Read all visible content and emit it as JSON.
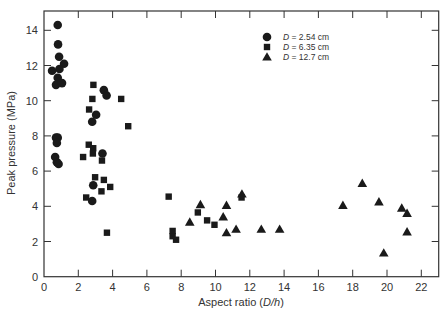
{
  "chart_data": {
    "type": "scatter",
    "title": "",
    "xlabel": "Aspect ratio (D/h)",
    "xlabel_plain": "Aspect ratio (",
    "xlabel_italic": "D/h",
    "xlabel_close": ")",
    "ylabel": "Peak pressure (MPa)",
    "xlim": [
      0,
      23
    ],
    "ylim": [
      0,
      15
    ],
    "xticks": [
      0,
      2,
      4,
      6,
      8,
      10,
      12,
      14,
      16,
      18,
      20,
      22
    ],
    "yticks": [
      0,
      2,
      4,
      6,
      8,
      10,
      12,
      14
    ],
    "grid": false,
    "legend_position": "upper center-right",
    "series": [
      {
        "name": "D = 2.54 cm",
        "marker": "circle",
        "points": [
          [
            0.8,
            14.3
          ],
          [
            0.82,
            13.2
          ],
          [
            0.88,
            12.5
          ],
          [
            1.17,
            12.1
          ],
          [
            0.47,
            11.7
          ],
          [
            0.9,
            11.8
          ],
          [
            0.8,
            11.3
          ],
          [
            0.7,
            10.9
          ],
          [
            1.05,
            11.0
          ],
          [
            0.7,
            7.9
          ],
          [
            0.8,
            7.9
          ],
          [
            0.75,
            7.6
          ],
          [
            0.65,
            6.8
          ],
          [
            0.75,
            6.5
          ],
          [
            0.85,
            6.4
          ],
          [
            3.49,
            10.6
          ],
          [
            3.65,
            10.3
          ],
          [
            3.04,
            9.2
          ],
          [
            2.81,
            8.8
          ],
          [
            3.41,
            7.0
          ],
          [
            2.87,
            5.2
          ],
          [
            2.81,
            4.3
          ]
        ]
      },
      {
        "name": "D = 6.35 cm",
        "marker": "square",
        "points": [
          [
            2.88,
            10.9
          ],
          [
            2.82,
            10.1
          ],
          [
            4.5,
            10.1
          ],
          [
            2.63,
            9.5
          ],
          [
            4.91,
            8.55
          ],
          [
            2.61,
            7.5
          ],
          [
            2.87,
            7.3
          ],
          [
            2.85,
            7.0
          ],
          [
            2.28,
            6.8
          ],
          [
            3.38,
            6.6
          ],
          [
            2.98,
            5.65
          ],
          [
            3.49,
            5.5
          ],
          [
            3.86,
            5.1
          ],
          [
            3.35,
            4.85
          ],
          [
            2.46,
            4.5
          ],
          [
            3.67,
            2.5
          ],
          [
            7.27,
            4.55
          ],
          [
            8.97,
            3.65
          ],
          [
            9.51,
            3.2
          ],
          [
            9.94,
            2.95
          ],
          [
            11.52,
            4.5
          ],
          [
            7.5,
            2.6
          ],
          [
            7.5,
            2.3
          ],
          [
            7.7,
            2.1
          ]
        ]
      },
      {
        "name": "D = 12.7 cm",
        "marker": "triangle",
        "points": [
          [
            9.12,
            4.1
          ],
          [
            10.64,
            4.05
          ],
          [
            11.54,
            4.7
          ],
          [
            8.5,
            3.1
          ],
          [
            10.45,
            3.4
          ],
          [
            10.64,
            2.5
          ],
          [
            11.2,
            2.7
          ],
          [
            12.67,
            2.7
          ],
          [
            13.74,
            2.7
          ],
          [
            17.43,
            4.05
          ],
          [
            18.56,
            5.3
          ],
          [
            19.53,
            4.25
          ],
          [
            20.86,
            3.9
          ],
          [
            21.17,
            3.6
          ],
          [
            21.17,
            2.55
          ],
          [
            19.81,
            1.35
          ]
        ]
      }
    ],
    "legend": [
      {
        "marker": "circle",
        "label_var": "D",
        "label_rest": " = 2.54 cm"
      },
      {
        "marker": "square",
        "label_var": "D",
        "label_rest": " = 6.35 cm"
      },
      {
        "marker": "triangle",
        "label_var": "D",
        "label_rest": " = 12.7 cm"
      }
    ]
  },
  "style": {
    "marker_color": "#1a1a1a",
    "axis_color": "#333333",
    "background": "#ffffff"
  }
}
